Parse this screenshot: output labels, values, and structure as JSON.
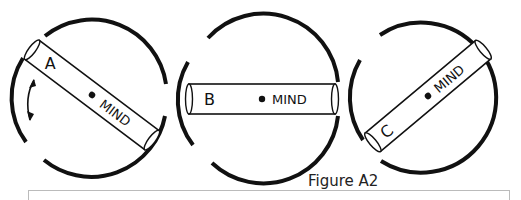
{
  "figure": {
    "caption": "Figure A2",
    "panels": [
      {
        "id": "A",
        "label": "A",
        "center_label": "MIND",
        "orientation": "tilted-down-right",
        "has_rotation_arrow": true
      },
      {
        "id": "B",
        "label": "B",
        "center_label": "MIND",
        "orientation": "horizontal",
        "has_rotation_arrow": false
      },
      {
        "id": "C",
        "label": "C",
        "center_label": "MIND",
        "orientation": "tilted-up-right",
        "has_rotation_arrow": false
      }
    ]
  },
  "colors": {
    "stroke": "#111111",
    "background": "#ffffff",
    "box_border": "#bbbbbb"
  }
}
